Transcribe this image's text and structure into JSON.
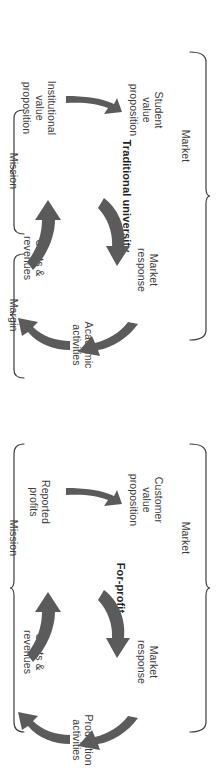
{
  "figure": {
    "type": "business-model-cycle-diagram",
    "orientation": "rotated-90-ccw",
    "accent_color": "#5b5b5b",
    "line_color": "#3d3d3d",
    "text_color": "#3d3d3d"
  },
  "diagrams": [
    {
      "id": "traditional",
      "center_label": "Traditional university",
      "nodes": [
        {
          "id": "student-value-proposition",
          "label": "Student\nvalue\nproposition"
        },
        {
          "id": "market-response",
          "label": "Market\nresponse"
        },
        {
          "id": "academic-activities",
          "label": "Academic\nactivities"
        },
        {
          "id": "costs-revenues",
          "label": "Costs &\nrevenues"
        },
        {
          "id": "institutional-value-proposition",
          "label": "Institutional\nvalue\nproposition"
        }
      ],
      "braces": [
        {
          "id": "market",
          "label": "Market"
        },
        {
          "id": "mission",
          "label": "Mission"
        },
        {
          "id": "margin",
          "label": "Margin"
        }
      ]
    },
    {
      "id": "forprofit",
      "center_label": "For-profit",
      "nodes": [
        {
          "id": "customer-value-proposition",
          "label": "Customer\nvalue\nproposition"
        },
        {
          "id": "market-response",
          "label": "Market\nresponse"
        },
        {
          "id": "production-activities",
          "label": "Production\nactivities"
        },
        {
          "id": "costs-revenues",
          "label": "Costs &\nrevenues"
        },
        {
          "id": "reported-profits",
          "label": "Reported\nprofits"
        }
      ],
      "braces": [
        {
          "id": "market",
          "label": "Market"
        },
        {
          "id": "mission",
          "label": "Mission"
        }
      ]
    }
  ]
}
